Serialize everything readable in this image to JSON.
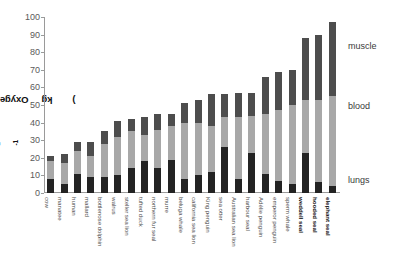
{
  "chart_data": {
    "type": "bar",
    "stacked": true,
    "title": "",
    "xlabel": "",
    "ylabel": "Oxygen stores (ml O2 kg-1)",
    "ylabel_parts": {
      "prefix": "Oxygen stores (ml O",
      "sub": "2",
      "mid": " kg",
      "sup": "-1",
      "suffix": ")"
    },
    "ylim": [
      0,
      100
    ],
    "yticks": [
      0,
      10,
      20,
      30,
      40,
      50,
      60,
      70,
      80,
      90,
      100
    ],
    "grid": false,
    "legend_position": "right",
    "categories": [
      "cow",
      "manatee",
      "human",
      "mallard",
      "bottlenose dolphin",
      "walrus",
      "steller sea lion",
      "tufted duck",
      "northern fur seal",
      "murre",
      "beluga whale",
      "california sea lion",
      "King penguin",
      "sea otter",
      "Australian sea lion",
      "harbour seal",
      "Adélie penguin",
      "emperor penguin",
      "sperm whale",
      "weddell seal",
      "hooded seal",
      "elephant seal"
    ],
    "categories_bold": [
      "weddell seal",
      "hooded seal",
      "elephant seal"
    ],
    "series": [
      {
        "name": "lungs",
        "color": "#232323",
        "values": [
          8,
          5,
          11,
          9,
          9,
          10,
          14,
          18,
          14,
          19,
          8,
          10,
          12,
          26,
          8,
          23,
          11,
          7,
          5,
          23,
          6,
          4
        ]
      },
      {
        "name": "blood",
        "color": "#a8a8a8",
        "values": [
          10,
          12,
          13,
          12,
          19,
          22,
          21,
          15,
          22,
          19,
          32,
          30,
          26,
          17,
          35,
          21,
          34,
          40,
          45,
          30,
          47,
          51
        ]
      },
      {
        "name": "muscle",
        "color": "#4d4d4d",
        "values": [
          3,
          5,
          5,
          8,
          7,
          9,
          7,
          10,
          9,
          7,
          11,
          13,
          18,
          13,
          14,
          13,
          21,
          22,
          20,
          35,
          37,
          42
        ]
      }
    ],
    "totals": [
      21,
      22,
      29,
      29,
      35,
      41,
      42,
      43,
      45,
      45,
      51,
      53,
      56,
      56,
      57,
      57,
      66,
      69,
      70,
      88,
      90,
      97
    ],
    "legend": [
      "muscle",
      "blood",
      "lungs"
    ]
  }
}
